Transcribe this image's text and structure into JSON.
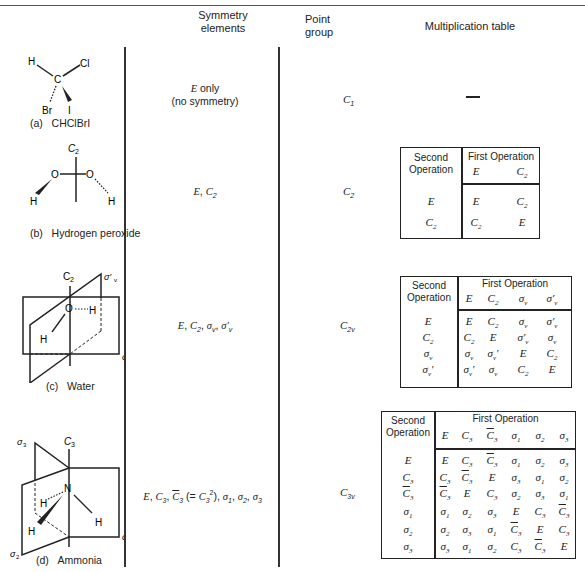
{
  "headers": {
    "symmetry": "Symmetry elements",
    "symmetry_l1": "Symmetry",
    "symmetry_l2": "elements",
    "point_l1": "Point",
    "point_l2": "group",
    "mult": "Multiplication table"
  },
  "rows": [
    {
      "caption_letter": "(a)",
      "caption": "CHClBrI",
      "symmetry_l1": "E only",
      "symmetry_l2": "(no symmetry)",
      "point_group": "C1",
      "mult_table": "—"
    },
    {
      "caption_letter": "(b)",
      "caption": "Hydrogen peroxide",
      "symmetry": "E, C2",
      "point_group": "C2",
      "mult_table": {
        "second_label": "Second Operation",
        "first_label": "First Operation",
        "columns": [
          "E",
          "C2"
        ],
        "rows": [
          {
            "op": "E",
            "cells": [
              "E",
              "C2"
            ]
          },
          {
            "op": "C2",
            "cells": [
              "C2",
              "E"
            ]
          }
        ]
      }
    },
    {
      "caption_letter": "(c)",
      "caption": "Water",
      "symmetry": "E, C2, σv, σ'v",
      "point_group": "C2v",
      "mult_table": {
        "second_label": "Second Operation",
        "first_label": "First Operation",
        "columns": [
          "E",
          "C2",
          "σv",
          "σ'v"
        ],
        "rows": [
          {
            "op": "E",
            "cells": [
              "E",
              "C2",
              "σv",
              "σ'v"
            ]
          },
          {
            "op": "C2",
            "cells": [
              "C2",
              "E",
              "σ'v",
              "σv"
            ]
          },
          {
            "op": "σv",
            "cells": [
              "σv",
              "σv'",
              "E",
              "C2"
            ]
          },
          {
            "op": "σv'",
            "cells": [
              "σv'",
              "σv",
              "C2",
              "E"
            ]
          }
        ]
      }
    },
    {
      "caption_letter": "(d)",
      "caption": "Ammonia",
      "symmetry": "E, C3, C̄3 (= C3²), σ1, σ2, σ3",
      "point_group": "C3v",
      "mult_table": {
        "second_label": "Second Operation",
        "first_label": "First Operation",
        "columns": [
          "E",
          "C3",
          "C̄3",
          "σ1",
          "σ2",
          "σ3"
        ],
        "rows": [
          {
            "op": "E",
            "cells": [
              "E",
              "C3",
              "C̄3",
              "σ1",
              "σ2",
              "σ3"
            ]
          },
          {
            "op": "C3",
            "cells": [
              "C3",
              "C̄3",
              "E",
              "σ3",
              "σ1",
              "σ2"
            ]
          },
          {
            "op": "C̄3",
            "cells": [
              "C̄3",
              "E",
              "C3",
              "σ2",
              "σ3",
              "σ1"
            ]
          },
          {
            "op": "σ1",
            "cells": [
              "σ1",
              "σ2",
              "σ3",
              "E",
              "C3",
              "C̄3"
            ]
          },
          {
            "op": "σ2",
            "cells": [
              "σ2",
              "σ3",
              "σ1",
              "C̄3",
              "E",
              "C3"
            ]
          },
          {
            "op": "σ3",
            "cells": [
              "σ3",
              "σ1",
              "σ2",
              "C3",
              "C̄3",
              "E"
            ]
          }
        ]
      }
    }
  ],
  "diagram_labels": {
    "a": {
      "H": "H",
      "Cl": "Cl",
      "C": "C",
      "Br": "Br",
      "I": "I"
    },
    "b": {
      "axis": "C2",
      "O": "O",
      "H": "H"
    },
    "c": {
      "axis": "C2",
      "plane1": "σ'v",
      "plane2": "σv",
      "O": "O",
      "H": "H"
    },
    "d": {
      "axis": "C3",
      "s1": "σ1",
      "s2": "σ2",
      "s3": "σ3",
      "N": "N",
      "H": "H"
    }
  }
}
